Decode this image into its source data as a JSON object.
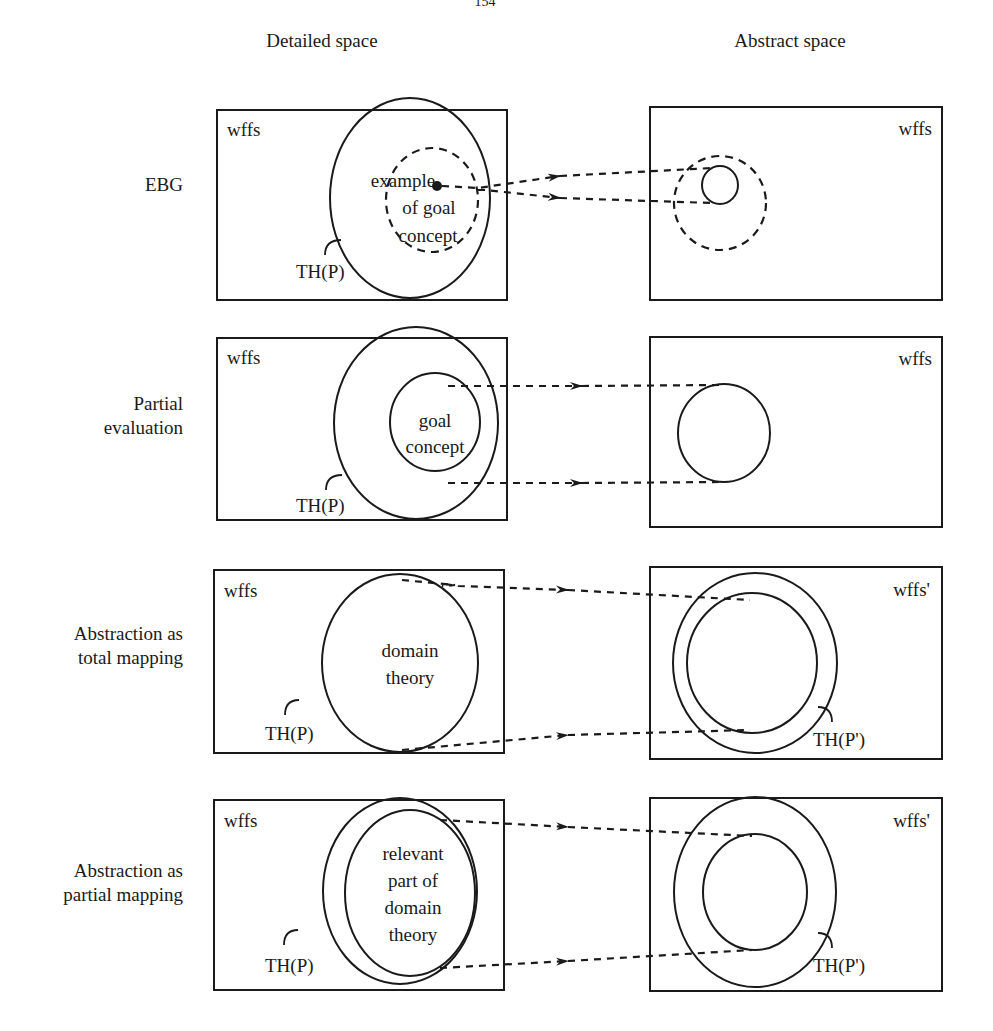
{
  "page_number": "154",
  "columns": {
    "detailed": "Detailed space",
    "abstract": "Abstract space"
  },
  "rows": [
    {
      "id": "ebg",
      "label_lines": [
        "EBG"
      ],
      "detailed": {
        "set_label": "wffs",
        "theory_label": "TH(P)",
        "inner_text": [
          "example",
          "of  goal",
          "concept"
        ]
      },
      "abstract": {
        "set_label": "wffs"
      }
    },
    {
      "id": "partial-evaluation",
      "label_lines": [
        "Partial",
        "evaluation"
      ],
      "detailed": {
        "set_label": "wffs",
        "theory_label": "TH(P)",
        "inner_text": [
          "goal",
          "concept"
        ]
      },
      "abstract": {
        "set_label": "wffs"
      }
    },
    {
      "id": "abstraction-total",
      "label_lines": [
        "Abstraction  as",
        "total  mapping"
      ],
      "detailed": {
        "set_label": "wffs",
        "theory_label": "TH(P)",
        "inner_text": [
          "domain",
          "theory"
        ]
      },
      "abstract": {
        "set_label": "wffs'",
        "theory_label": "TH(P')"
      }
    },
    {
      "id": "abstraction-partial",
      "label_lines": [
        "Abstraction  as",
        "partial  mapping"
      ],
      "detailed": {
        "set_label": "wffs",
        "theory_label": "TH(P)",
        "inner_text": [
          "relevant",
          "part  of",
          "domain",
          "theory"
        ]
      },
      "abstract": {
        "set_label": "wffs'",
        "theory_label": "TH(P')"
      }
    }
  ]
}
